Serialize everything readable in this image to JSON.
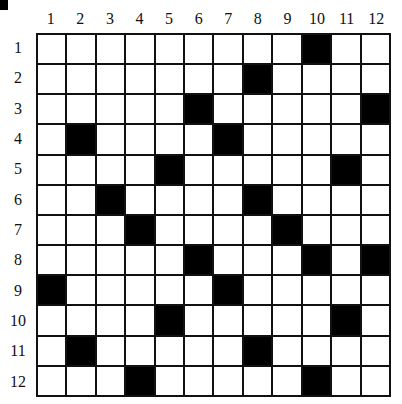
{
  "puzzle": {
    "rows": 12,
    "cols": 12,
    "column_labels": [
      "1",
      "2",
      "3",
      "4",
      "5",
      "6",
      "7",
      "8",
      "9",
      "10",
      "11",
      "12"
    ],
    "row_labels": [
      "1",
      "2",
      "3",
      "4",
      "5",
      "6",
      "7",
      "8",
      "9",
      "10",
      "11",
      "12"
    ],
    "black_cells": [
      [
        1,
        10
      ],
      [
        2,
        8
      ],
      [
        3,
        6
      ],
      [
        3,
        12
      ],
      [
        4,
        2
      ],
      [
        4,
        7
      ],
      [
        5,
        5
      ],
      [
        5,
        11
      ],
      [
        6,
        3
      ],
      [
        6,
        8
      ],
      [
        7,
        4
      ],
      [
        7,
        9
      ],
      [
        8,
        6
      ],
      [
        8,
        10
      ],
      [
        8,
        12
      ],
      [
        9,
        1
      ],
      [
        9,
        7
      ],
      [
        10,
        5
      ],
      [
        10,
        11
      ],
      [
        11,
        2
      ],
      [
        11,
        8
      ],
      [
        12,
        4
      ],
      [
        12,
        10
      ]
    ],
    "colors": {
      "black_cell": "#000000",
      "white_cell": "#ffffff",
      "grid_line": "#111111"
    }
  }
}
